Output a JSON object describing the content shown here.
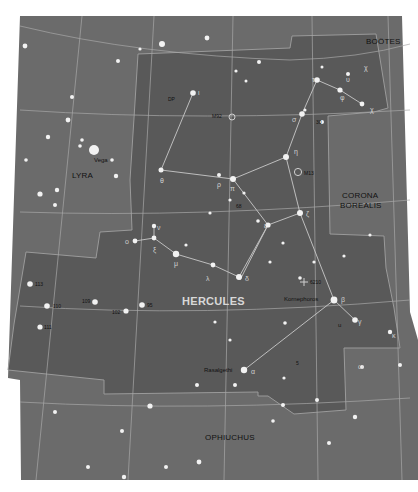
{
  "map": {
    "title": "HERCULES",
    "colors": {
      "background": "#ffffff",
      "sky_outer": "#6b6b6b",
      "constellation_fill": "#595959",
      "grid_line": "#a8a8a8",
      "boundary_line": "#9a9a9a",
      "stick_line": "#c8c8c8",
      "star": "#f2f2f2",
      "label_dark": "#111111",
      "label_light": "#d8d8d8"
    },
    "constellations": [
      {
        "name": "HERCULES",
        "x": 182,
        "y": 302
      },
      {
        "name": "LYRA",
        "x": 72,
        "y": 176
      },
      {
        "name": "BOÖTES",
        "x": 366,
        "y": 42
      },
      {
        "name": "CORONA",
        "x": 342,
        "y": 196
      },
      {
        "name": "BOREALIS",
        "x": 340,
        "y": 206
      },
      {
        "name": "OPHIUCHUS",
        "x": 205,
        "y": 438
      }
    ],
    "named_stars": [
      {
        "name": "Vega",
        "x": 94,
        "y": 156
      },
      {
        "name": "Kornephoros",
        "x": 284,
        "y": 298
      },
      {
        "name": "Rasalgethi",
        "x": 204,
        "y": 369
      }
    ],
    "deep_sky": [
      {
        "name": "M92",
        "x": 212,
        "y": 116
      },
      {
        "name": "M13",
        "x": 302,
        "y": 173
      },
      {
        "name": "6210",
        "x": 306,
        "y": 282
      }
    ],
    "greek_labels": [
      {
        "text": "χ",
        "x": 366,
        "y": 68
      },
      {
        "text": "υ",
        "x": 346,
        "y": 78
      },
      {
        "text": "τ",
        "x": 314,
        "y": 79
      },
      {
        "text": "φ",
        "x": 342,
        "y": 93
      },
      {
        "text": "χ",
        "x": 369,
        "y": 107
      },
      {
        "text": "σ",
        "x": 291,
        "y": 117
      },
      {
        "text": "ι",
        "x": 198,
        "y": 93
      },
      {
        "text": "η",
        "x": 297,
        "y": 152
      },
      {
        "text": "θ",
        "x": 160,
        "y": 177
      },
      {
        "text": "ρ",
        "x": 219,
        "y": 180
      },
      {
        "text": "π",
        "x": 231,
        "y": 183
      },
      {
        "text": "ζ",
        "x": 309,
        "y": 211
      },
      {
        "text": "ε",
        "x": 265,
        "y": 222
      },
      {
        "text": "ν",
        "x": 157,
        "y": 226
      },
      {
        "text": "ο",
        "x": 127,
        "y": 240
      },
      {
        "text": "ξ",
        "x": 153,
        "y": 248
      },
      {
        "text": "μ",
        "x": 175,
        "y": 261
      },
      {
        "text": "λ",
        "x": 207,
        "y": 275
      },
      {
        "text": "δ",
        "x": 245,
        "y": 276
      },
      {
        "text": "β",
        "x": 342,
        "y": 300
      },
      {
        "text": "γ",
        "x": 358,
        "y": 321
      },
      {
        "text": "u",
        "x": 340,
        "y": 324
      },
      {
        "text": "κ",
        "x": 392,
        "y": 335
      },
      {
        "text": "α",
        "x": 251,
        "y": 372
      },
      {
        "text": "ω",
        "x": 360,
        "y": 366
      }
    ],
    "flamsteed": [
      {
        "text": "DP",
        "x": 168,
        "y": 98
      },
      {
        "text": "30",
        "x": 315,
        "y": 122
      },
      {
        "text": "68",
        "x": 236,
        "y": 206
      },
      {
        "text": "113",
        "x": 35,
        "y": 284
      },
      {
        "text": "109",
        "x": 82,
        "y": 300
      },
      {
        "text": "110",
        "x": 53,
        "y": 306
      },
      {
        "text": "95",
        "x": 147,
        "y": 305
      },
      {
        "text": "102",
        "x": 113,
        "y": 311
      },
      {
        "text": "111",
        "x": 44,
        "y": 327
      },
      {
        "text": "5",
        "x": 296,
        "y": 363
      }
    ]
  }
}
